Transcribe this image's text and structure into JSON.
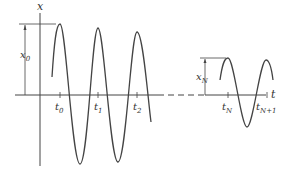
{
  "diagram": {
    "title": "",
    "colors": {
      "stroke": "#444444",
      "text": "#333333",
      "background": "#ffffff"
    },
    "axes": {
      "vertical_label": "x",
      "horizontal_label": "t"
    },
    "amplitude_labels": {
      "initial": {
        "base": "x",
        "sub": "0"
      },
      "final": {
        "base": "x",
        "sub": "N"
      }
    },
    "time_ticks": [
      {
        "base": "t",
        "sub": "0"
      },
      {
        "base": "t",
        "sub": "1"
      },
      {
        "base": "t",
        "sub": "2"
      },
      {
        "base": "t",
        "sub": "N"
      },
      {
        "base": "t",
        "sub": "N+1"
      }
    ]
  }
}
